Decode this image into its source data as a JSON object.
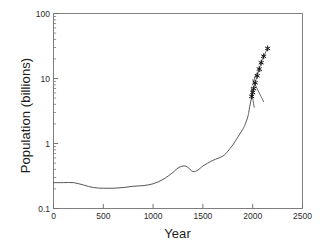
{
  "chart_data": {
    "type": "line",
    "title": "",
    "xlabel": "Year",
    "ylabel": "Population (billions)",
    "xlim": [
      0,
      2500
    ],
    "ylim": [
      0.1,
      100
    ],
    "yscale": "log",
    "xscale": "linear",
    "grid": false,
    "legend": "none",
    "xticks": [
      0,
      500,
      1000,
      1500,
      2000,
      2500
    ],
    "xticklabels": [
      "0",
      "500",
      "1000",
      "1500",
      "2000",
      "2500"
    ],
    "yticks": [
      0.1,
      1,
      10,
      100
    ],
    "yticklabels": [
      "0.1",
      "1",
      "10",
      "100"
    ],
    "yminorticks": [
      0.2,
      0.3,
      0.4,
      0.5,
      0.6,
      0.7,
      0.8,
      0.9,
      2,
      3,
      4,
      5,
      6,
      7,
      8,
      9,
      20,
      30,
      40,
      50,
      60,
      70,
      80,
      90
    ],
    "series": [
      {
        "name": "historical-population",
        "style": "line",
        "x": [
          0,
          100,
          200,
          300,
          400,
          500,
          600,
          700,
          800,
          900,
          1000,
          1100,
          1200,
          1250,
          1300,
          1340,
          1400,
          1450,
          1500,
          1600,
          1700,
          1750,
          1800,
          1850,
          1900,
          1920,
          1950,
          1960,
          1970,
          1980,
          1990,
          2000
        ],
        "y": [
          0.25,
          0.25,
          0.25,
          0.23,
          0.21,
          0.205,
          0.205,
          0.21,
          0.22,
          0.225,
          0.24,
          0.28,
          0.36,
          0.42,
          0.45,
          0.44,
          0.37,
          0.39,
          0.45,
          0.55,
          0.64,
          0.76,
          0.95,
          1.25,
          1.65,
          1.9,
          2.55,
          3.0,
          3.7,
          4.45,
          5.3,
          6.1
        ]
      },
      {
        "name": "projection-markers",
        "style": "star-markers-with-line",
        "x": [
          1990,
          2000,
          2010,
          2025,
          2045,
          2065,
          2085,
          2110,
          2150
        ],
        "y": [
          5.3,
          6.1,
          7.0,
          8.6,
          11.0,
          14.0,
          17.5,
          22.0,
          29.0
        ]
      },
      {
        "name": "scenario-high-plateau",
        "style": "line",
        "x": [
          2000,
          2030,
          2060,
          2090
        ],
        "y": [
          8.0,
          11.5,
          12.8,
          13.2
        ]
      },
      {
        "name": "scenario-decline",
        "style": "line",
        "x": [
          2000,
          2040,
          2080,
          2110
        ],
        "y": [
          9.6,
          7.2,
          5.4,
          4.4
        ]
      },
      {
        "name": "scenario-steep-decline",
        "style": "line",
        "x": [
          1985,
          2000,
          2015
        ],
        "y": [
          7.2,
          5.0,
          3.6
        ]
      }
    ]
  },
  "axes": {
    "x_title": "Year",
    "y_title": "Population (billions)"
  },
  "colors": {
    "line": "#4d4d4d",
    "marker": "#111111",
    "axis": "#6f6f6f",
    "text": "#1d1d1d",
    "background": "#ffffff"
  }
}
